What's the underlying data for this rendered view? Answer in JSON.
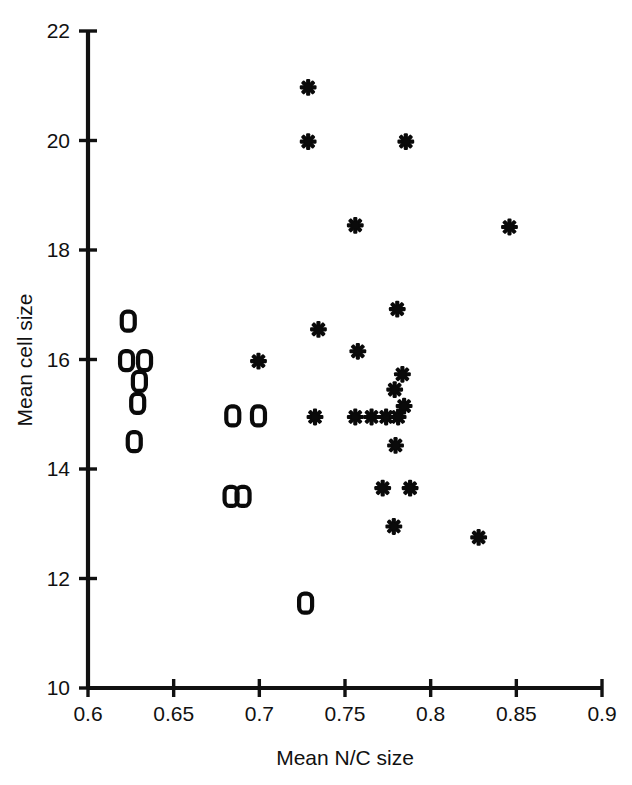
{
  "chart_data": {
    "type": "scatter",
    "title": "",
    "xlabel": "Mean N/C size",
    "ylabel": "Mean cell size",
    "xlim": [
      0.6,
      0.9
    ],
    "ylim": [
      10,
      22
    ],
    "xticks": [
      0.6,
      0.65,
      0.7,
      0.75,
      0.8,
      0.85,
      0.9
    ],
    "xtick_labels": [
      "0.6",
      "0.65",
      "0.7",
      "0.75",
      "0.8",
      "0.85",
      "0.9"
    ],
    "yticks": [
      10,
      12,
      14,
      16,
      18,
      20,
      22
    ],
    "ytick_labels": [
      "10",
      "12",
      "14",
      "16",
      "18",
      "20",
      "22"
    ],
    "grid": false,
    "legend": false,
    "series": [
      {
        "name": "open-marker-group",
        "marker": "open-rounded-square",
        "points": [
          [
            0.6235,
            16.7
          ],
          [
            0.6225,
            15.98
          ],
          [
            0.633,
            15.98
          ],
          [
            0.63,
            15.6
          ],
          [
            0.629,
            15.2
          ],
          [
            0.627,
            14.5
          ],
          [
            0.6845,
            14.97
          ],
          [
            0.6995,
            14.97
          ],
          [
            0.6835,
            13.5
          ],
          [
            0.6905,
            13.5
          ],
          [
            0.727,
            11.55
          ]
        ]
      },
      {
        "name": "asterisk-marker-group",
        "marker": "asterisk",
        "points": [
          [
            0.7285,
            20.97
          ],
          [
            0.7285,
            19.98
          ],
          [
            0.7855,
            19.98
          ],
          [
            0.756,
            18.45
          ],
          [
            0.846,
            18.42
          ],
          [
            0.7805,
            16.92
          ],
          [
            0.7345,
            16.55
          ],
          [
            0.7575,
            16.15
          ],
          [
            0.6995,
            15.97
          ],
          [
            0.7835,
            15.73
          ],
          [
            0.779,
            15.45
          ],
          [
            0.7845,
            15.15
          ],
          [
            0.7325,
            14.95
          ],
          [
            0.756,
            14.95
          ],
          [
            0.7655,
            14.95
          ],
          [
            0.774,
            14.95
          ],
          [
            0.781,
            14.95
          ],
          [
            0.7795,
            14.43
          ],
          [
            0.772,
            13.65
          ],
          [
            0.788,
            13.65
          ],
          [
            0.7785,
            12.95
          ],
          [
            0.828,
            12.75
          ]
        ]
      }
    ]
  },
  "axes": {
    "x_title": "Mean N/C size",
    "y_title": "Mean cell size"
  }
}
